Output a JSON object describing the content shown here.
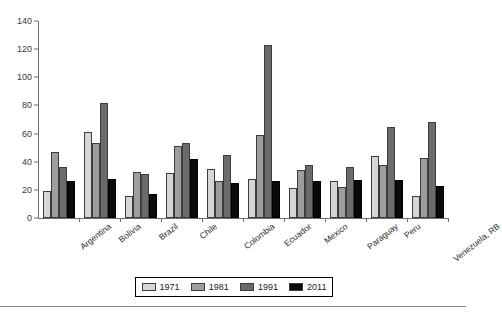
{
  "chart_data": {
    "type": "bar",
    "title": "",
    "subtitle": "",
    "xlabel": "",
    "ylabel": "",
    "ylim": [
      0,
      140
    ],
    "yticks": [
      0,
      20,
      40,
      60,
      80,
      100,
      120,
      140
    ],
    "grid": false,
    "legend_position": "bottom",
    "categories": [
      "Argentina",
      "Bolivia",
      "Brazil",
      "Chile",
      "Colombia",
      "Ecuador",
      "Mexico",
      "Paraguay",
      "Peru",
      "Venezuela, RB"
    ],
    "series": [
      {
        "name": "1971",
        "color": "#d6d6d6",
        "values": [
          19,
          61,
          16,
          32,
          35,
          28,
          21,
          26,
          44,
          16
        ]
      },
      {
        "name": "1981",
        "color": "#9d9d9d",
        "values": [
          47,
          53,
          33,
          51,
          26,
          59,
          34,
          22,
          38,
          43
        ]
      },
      {
        "name": "1991",
        "color": "#6b6b6b",
        "values": [
          36,
          82,
          31,
          53,
          45,
          123,
          38,
          36,
          65,
          68
        ]
      },
      {
        "name": "2011",
        "color": "#0a0a0a",
        "values": [
          26,
          28,
          17,
          42,
          25,
          26,
          26,
          27,
          27,
          23
        ]
      }
    ]
  },
  "legend": {
    "items": [
      {
        "label": "1971",
        "color": "#d6d6d6"
      },
      {
        "label": "1981",
        "color": "#9d9d9d"
      },
      {
        "label": "1991",
        "color": "#6b6b6b"
      },
      {
        "label": "2011",
        "color": "#0a0a0a"
      }
    ]
  },
  "axis": {
    "y_tick_labels": [
      "140",
      "120",
      "100",
      "80",
      "60",
      "40",
      "20",
      "0"
    ]
  }
}
